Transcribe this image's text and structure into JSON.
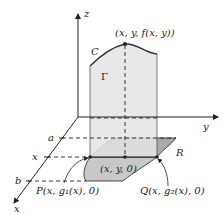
{
  "diagram": {
    "type": "3d-surface-region",
    "axes": {
      "z_label": "z",
      "y_label": "y",
      "x_label": "x"
    },
    "x_axis_ticks": {
      "a": "a",
      "x": "x",
      "b": "b"
    },
    "labels": {
      "surface_point": "(x, y, f(x, y))",
      "curve_C": "C",
      "cross_section_Gamma": "Γ",
      "region_R": "R",
      "base_point": "(x, y, 0)",
      "point_P": "P(x, g₁(x), 0)",
      "point_Q": "Q(x, g₂(x), 0)"
    },
    "colors": {
      "wall_fill": "#e4e4e4",
      "region_fill_light": "#c8c8c8",
      "region_fill_dark": "#a9a9a9",
      "stroke": "#222222"
    }
  }
}
